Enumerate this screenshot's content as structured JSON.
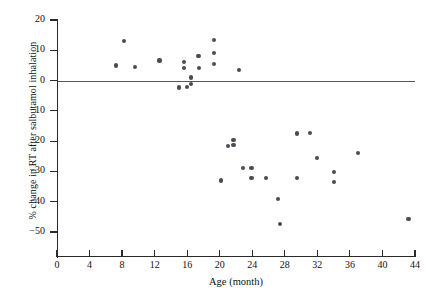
{
  "chart_data": {
    "type": "scatter",
    "title": "",
    "xlabel": "Age (month)",
    "ylabel": "% change in RT after salbutamol inhalation",
    "xlim": [
      0,
      44
    ],
    "ylim": [
      -55,
      20
    ],
    "xticks": [
      0,
      4,
      8,
      12,
      16,
      20,
      24,
      28,
      32,
      36,
      40,
      44
    ],
    "yticks": [
      20,
      10,
      0,
      -10,
      -20,
      -30,
      -40,
      -50
    ],
    "xtick_labels": [
      "0",
      "4",
      "8",
      "12",
      "16",
      "20",
      "24",
      "28",
      "32",
      "36",
      "40",
      "44"
    ],
    "ytick_labels": [
      "20",
      "10",
      "0",
      "−10",
      "−20",
      "−30",
      "−40",
      "−50"
    ],
    "grid": false,
    "legend": null,
    "reference_line": {
      "orientation": "horizontal",
      "value": 0,
      "color": "#55565a"
    },
    "marker": {
      "shape": "circle",
      "color": "#4b4b52",
      "size": 4.2
    },
    "points": [
      {
        "x": 7.3,
        "y": 5.0
      },
      {
        "x": 8.2,
        "y": 13.2
      },
      {
        "x": 9.6,
        "y": 4.6
      },
      {
        "x": 12.6,
        "y": 6.6
      },
      {
        "x": 15.6,
        "y": 6.0
      },
      {
        "x": 15.6,
        "y": 4.1
      },
      {
        "x": 16.5,
        "y": 1.0
      },
      {
        "x": 16.5,
        "y": -1.1
      },
      {
        "x": 15.0,
        "y": -2.3
      },
      {
        "x": 16.0,
        "y": -2.2
      },
      {
        "x": 17.4,
        "y": 8.0
      },
      {
        "x": 17.5,
        "y": 4.2
      },
      {
        "x": 19.3,
        "y": 13.5
      },
      {
        "x": 19.3,
        "y": 9.0
      },
      {
        "x": 19.3,
        "y": 5.4
      },
      {
        "x": 22.4,
        "y": 3.6
      },
      {
        "x": 20.2,
        "y": -33.0
      },
      {
        "x": 21.0,
        "y": -21.5
      },
      {
        "x": 21.7,
        "y": -19.5
      },
      {
        "x": 21.7,
        "y": -21.3
      },
      {
        "x": 22.9,
        "y": -28.8
      },
      {
        "x": 23.9,
        "y": -28.8
      },
      {
        "x": 23.9,
        "y": -32.2
      },
      {
        "x": 25.7,
        "y": -32.3
      },
      {
        "x": 27.2,
        "y": -39.0
      },
      {
        "x": 27.4,
        "y": -47.4
      },
      {
        "x": 29.5,
        "y": -17.5
      },
      {
        "x": 31.1,
        "y": -17.3
      },
      {
        "x": 29.5,
        "y": -32.3
      },
      {
        "x": 32.0,
        "y": -25.6
      },
      {
        "x": 34.0,
        "y": -30.2
      },
      {
        "x": 34.0,
        "y": -33.5
      },
      {
        "x": 37.0,
        "y": -24.0
      },
      {
        "x": 43.2,
        "y": -45.6
      }
    ]
  }
}
